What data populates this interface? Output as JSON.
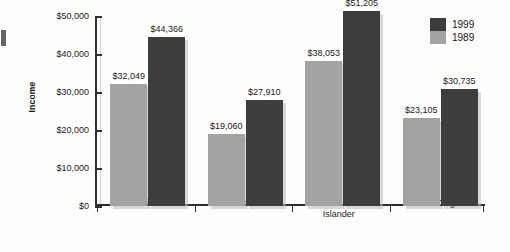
{
  "chart_data": {
    "type": "bar",
    "title": "",
    "subtitle": "",
    "xlabel": "",
    "ylabel": "Income",
    "ylim": [
      0,
      50000
    ],
    "ytick_labels": [
      "$0",
      "$10,000",
      "$20,000",
      "$30,000",
      "$40,000",
      "$50,000"
    ],
    "ytick_values": [
      0,
      10000,
      20000,
      30000,
      40000,
      50000
    ],
    "grid": false,
    "legend_position": "right-top",
    "categories": [
      "White",
      "African American",
      "Asian or Pacific Islander",
      "Latino Origin"
    ],
    "series": [
      {
        "name": "1989",
        "color": "#a3a3a3",
        "values": [
          32049,
          19060,
          38053,
          23105
        ],
        "value_labels": [
          "$32,049",
          "$19,060",
          "$38,053",
          "$23,105"
        ]
      },
      {
        "name": "1999",
        "color": "#3d3d3d",
        "values": [
          44366,
          27910,
          51205,
          30735
        ],
        "value_labels": [
          "$44,366",
          "$27,910",
          "$51,205",
          "$30,735"
        ]
      }
    ],
    "legend_entries": [
      {
        "label": "1999",
        "color": "#3d3d3d"
      },
      {
        "label": "1989",
        "color": "#a3a3a3"
      }
    ],
    "category_label_lines": [
      [
        "White"
      ],
      [
        "African American"
      ],
      [
        "Asian or Pacific",
        "Islander"
      ],
      [
        "Latino Origin"
      ]
    ]
  },
  "axis": {
    "y_title": "Income"
  }
}
